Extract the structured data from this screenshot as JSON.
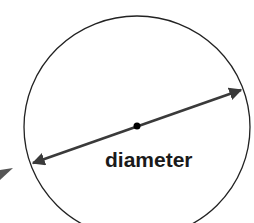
{
  "diagram": {
    "label": "diameter",
    "colors": {
      "circle": "#222222",
      "arrow": "#3a3a3a",
      "center": "#000000",
      "text": "#1a1a1a",
      "partial_arrow": "#555555"
    }
  }
}
